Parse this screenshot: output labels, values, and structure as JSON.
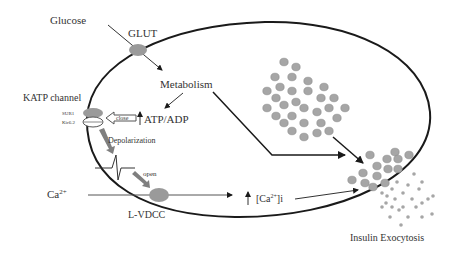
{
  "diagram": {
    "labels": {
      "glucose": "Glucose",
      "glut": "GLUT",
      "metabolism": "Metabolism",
      "katp_channel": "KATP channel",
      "sur1": "SUR1",
      "kir62": "Kir6.2",
      "close": "close",
      "atp_adp": "ATP/ADP",
      "depolarization": "Depolarization",
      "open": "open",
      "ca_ext": "Ca",
      "ca_ext_sup": "2+",
      "lvdcc": "L-VDCC",
      "ca_i_open": "[Ca",
      "ca_i_sup": "2+",
      "ca_i_close": "]i",
      "insulin_exocytosis": "Insulin Exocytosis"
    },
    "colors": {
      "membrane": "#1a1a1a",
      "channel_fill": "#9a9a9a",
      "granule_fill": "#a6a6a6",
      "granule_stroke": "#8a8a8a",
      "arrow_thick": "#7f7f7f",
      "text": "#333333"
    }
  }
}
